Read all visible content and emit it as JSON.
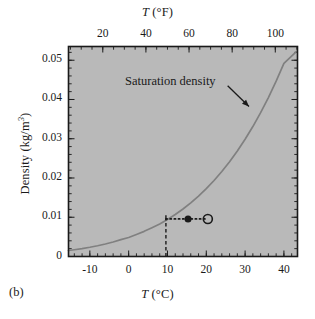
{
  "figure": {
    "panel_label": "(b)",
    "background_color": "#ffffff",
    "plot_background_color": "#b9b9b9",
    "frame_color": "#1a1a1a",
    "curve_color": "#808080",
    "marker_color": "#1a1a1a"
  },
  "chart_data": {
    "type": "line",
    "title": "",
    "xlabel": "T (°C)",
    "xlabel_text": "T",
    "xlabel_unit": "(°C)",
    "x2label_text": "T",
    "x2label_unit": "(°F)",
    "ylabel": "Density (kg/m³)",
    "ylabel_text": "Density (kg/m",
    "ylabel_exp": "3",
    "ylabel_close": ")",
    "xlim": [
      -15.5,
      43.5
    ],
    "x2lim": [
      4.1,
      110.3
    ],
    "ylim": [
      0,
      0.0535
    ],
    "xticks": [
      -10,
      0,
      10,
      20,
      30,
      40
    ],
    "xtick_labels": [
      "-10",
      "0",
      "10",
      "20",
      "30",
      "40"
    ],
    "x2ticks": [
      20,
      40,
      60,
      80,
      100
    ],
    "x2tick_labels": [
      "20",
      "40",
      "60",
      "80",
      "100"
    ],
    "yticks": [
      0,
      0.01,
      0.02,
      0.03,
      0.04,
      0.05
    ],
    "ytick_labels": [
      "0",
      "0.01",
      "0.02",
      "0.03",
      "0.04",
      "0.05"
    ],
    "minor_ticks": true,
    "grid": false,
    "legend": null,
    "annotations": [
      {
        "name": "saturation-density",
        "text": "Saturation density",
        "text_x": 9.5,
        "text_y": 0.0452,
        "arrow_from_x": 25.5,
        "arrow_from_y": 0.0435,
        "arrow_to_x": 31.0,
        "arrow_to_y": 0.0382
      }
    ],
    "series": [
      {
        "name": "Saturation density",
        "style": "solid",
        "color": "#808080",
        "x": [
          -15.5,
          -14,
          -12,
          -10,
          -8,
          -6,
          -4,
          -2,
          0,
          2,
          4,
          6,
          8,
          10,
          12,
          14,
          16,
          18,
          20,
          22,
          24,
          26,
          28,
          30,
          32,
          34,
          36,
          38,
          40,
          42,
          43.2
        ],
        "y": [
          0.00153,
          0.00172,
          0.00201,
          0.00235,
          0.00274,
          0.00319,
          0.0037,
          0.00429,
          0.00485,
          0.00561,
          0.00641,
          0.00733,
          0.00827,
          0.00941,
          0.01069,
          0.01211,
          0.01367,
          0.01539,
          0.01729,
          0.01937,
          0.02165,
          0.02414,
          0.02688,
          0.02986,
          0.03311,
          0.03665,
          0.04049,
          0.04466,
          0.04918,
          0.05408,
          0.0522
        ]
      }
    ],
    "markers": [
      {
        "name": "actual-vapor-density-point",
        "style": "filled-circle",
        "x": 15.3,
        "y": 0.00956,
        "size": 7
      },
      {
        "name": "dew-point-reference-point",
        "style": "open-circle",
        "x": 20.4,
        "y": 0.00956,
        "size": 9
      }
    ],
    "guide_lines": [
      {
        "name": "horizontal-dotted-guide",
        "style": "dotted",
        "orientation": "horizontal",
        "y": 0.00956,
        "x_start": 9.6,
        "x_end": 20.4
      },
      {
        "name": "vertical-dashed-guide",
        "style": "dashed",
        "orientation": "vertical",
        "x": 9.6,
        "y_start": 0.0,
        "y_end": 0.00956
      }
    ]
  }
}
